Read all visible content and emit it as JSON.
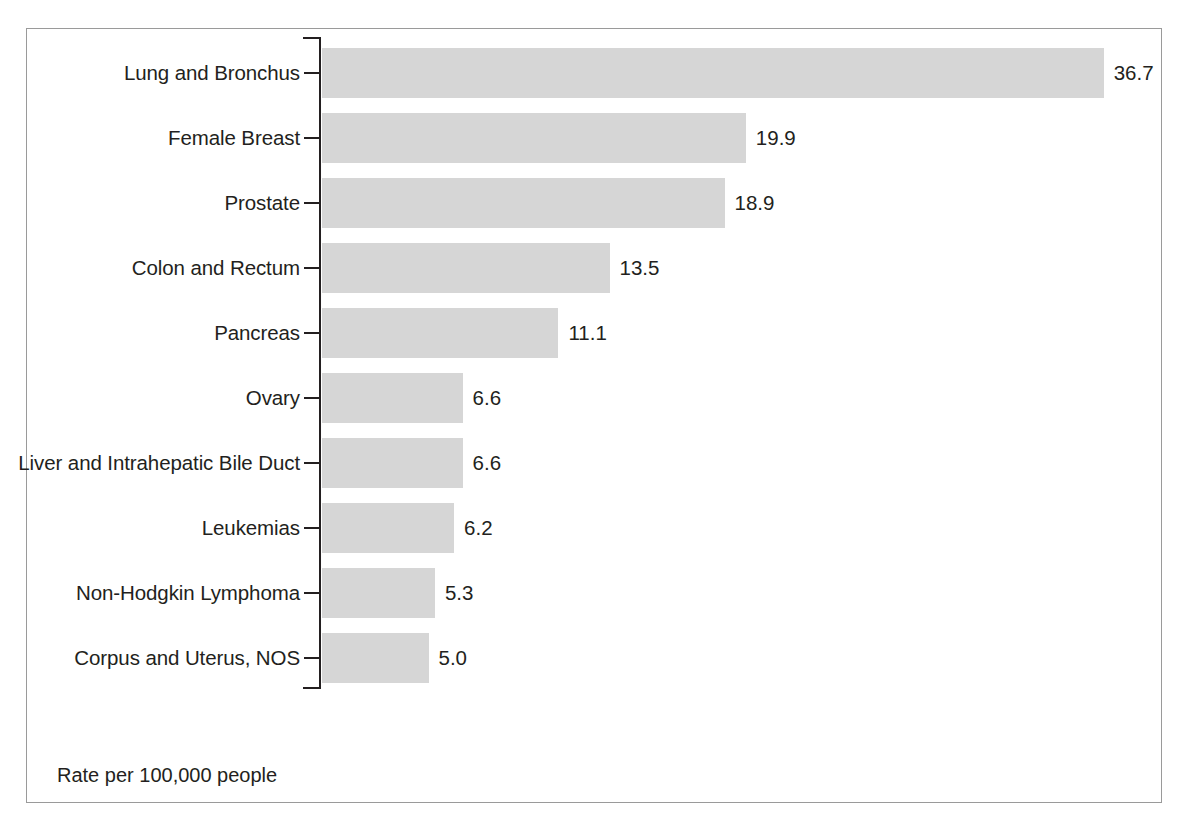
{
  "chart_data": {
    "type": "bar",
    "orientation": "horizontal",
    "title": "",
    "subtitle": "",
    "xlabel": "",
    "ylabel": "",
    "footnote": "Rate per 100,000 people",
    "grid": false,
    "legend": null,
    "xlim": [
      0,
      36.7
    ],
    "axis_ticks_visible": true,
    "value_label_format": "one-decimal",
    "bar_color": "#d6d6d6",
    "axis_color": "#231f20",
    "border_color": "#9a9a9a",
    "text_color": "#231f20",
    "categories": [
      "Lung and Bronchus",
      "Female Breast",
      "Prostate",
      "Colon and Rectum",
      "Pancreas",
      "Ovary",
      "Liver and Intrahepatic Bile Duct",
      "Leukemias",
      "Non-Hodgkin Lymphoma",
      "Corpus and Uterus, NOS"
    ],
    "values": [
      36.7,
      19.9,
      18.9,
      13.5,
      11.1,
      6.6,
      6.6,
      6.2,
      5.3,
      5.0
    ],
    "value_labels": [
      "36.7",
      "19.9",
      "18.9",
      "13.5",
      "11.1",
      "6.6",
      "6.6",
      "6.2",
      "5.3",
      "5.0"
    ]
  }
}
